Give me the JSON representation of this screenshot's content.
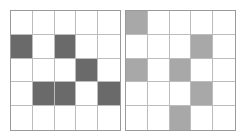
{
  "grids": [
    {
      "name": "left",
      "rows": 5,
      "cols": 5,
      "fill_color": "#6a6a6a",
      "filled_cells": [
        [
          1,
          0
        ],
        [
          1,
          2
        ],
        [
          2,
          3
        ],
        [
          3,
          1
        ],
        [
          3,
          2
        ],
        [
          3,
          4
        ]
      ]
    },
    {
      "name": "right",
      "rows": 5,
      "cols": 5,
      "fill_color": "#a8a8a8",
      "filled_cells": [
        [
          0,
          0
        ],
        [
          1,
          3
        ],
        [
          2,
          0
        ],
        [
          2,
          2
        ],
        [
          3,
          3
        ],
        [
          4,
          2
        ]
      ]
    }
  ],
  "colors": {
    "empty": "#ffffff",
    "grid_line": "#bcbcbc",
    "border": "#9a9a9a"
  }
}
